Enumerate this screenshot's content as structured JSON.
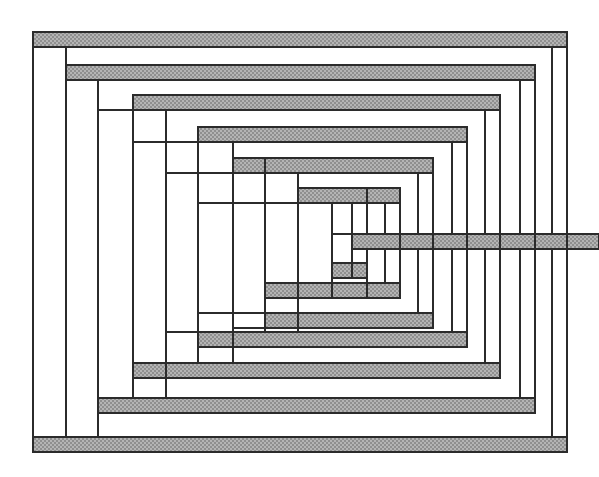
{
  "figure": {
    "type": "line-drawing",
    "canvas": {
      "width": 599,
      "height": 477
    },
    "colors": {
      "background": "#ffffff",
      "stroke": "#2b2b2b",
      "band_fill": "#a8a8a8",
      "corridor_fill": "#ffffff"
    },
    "geometry": {
      "stroke_width": 2.2,
      "corridor_thickness": 15,
      "description": "A single rectangular spiral corridor wound inward from the outer top-left, with the horizontal runs of each turn filled solid gray and the vertical runs left white; the innermost corridor escapes to the right edge through a gray horizontal tongue."
    },
    "turns": [
      {
        "index": 0,
        "left": 33,
        "top": 32,
        "right": 567,
        "bottom": 452
      },
      {
        "index": 1,
        "left": 66,
        "top": 65,
        "right": 535,
        "bottom": 413
      },
      {
        "index": 2,
        "left": 98,
        "top": 95,
        "right": 500,
        "bottom": 378
      },
      {
        "index": 3,
        "left": 133,
        "top": 127,
        "right": 467,
        "bottom": 347
      },
      {
        "index": 4,
        "left": 166,
        "top": 158,
        "right": 433,
        "bottom": 313
      },
      {
        "index": 5,
        "left": 198,
        "top": 188,
        "right": 400,
        "bottom": 283
      },
      {
        "index": 6,
        "left": 233,
        "top": 204,
        "right": 367,
        "bottom": 263
      }
    ],
    "exit": {
      "side": "right",
      "y_top": 234,
      "y_bottom": 249,
      "x_from": 352,
      "x_to": 599
    },
    "vertical_rule_x": [
      33,
      66,
      98,
      133,
      166,
      198,
      233,
      265,
      298,
      332,
      367,
      400,
      433,
      467,
      500,
      535,
      567
    ],
    "horizontal_band_y": [
      32,
      65,
      95,
      127,
      158,
      188,
      234,
      263,
      283,
      313,
      332,
      363,
      398,
      430
    ],
    "band_count": 14
  }
}
